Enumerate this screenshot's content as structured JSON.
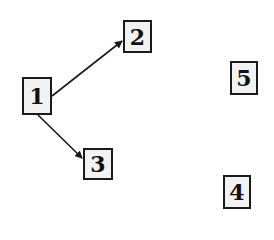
{
  "diagram": {
    "type": "directed-graph",
    "nodes": [
      {
        "id": "1",
        "label": "1",
        "x": 22,
        "y": 77,
        "w": 30,
        "h": 38
      },
      {
        "id": "2",
        "label": "2",
        "x": 123,
        "y": 20,
        "w": 29,
        "h": 33
      },
      {
        "id": "3",
        "label": "3",
        "x": 83,
        "y": 148,
        "w": 30,
        "h": 32
      },
      {
        "id": "4",
        "label": "4",
        "x": 223,
        "y": 175,
        "w": 28,
        "h": 34
      },
      {
        "id": "5",
        "label": "5",
        "x": 230,
        "y": 61,
        "w": 28,
        "h": 34
      }
    ],
    "edges": [
      {
        "from": "1",
        "to": "2"
      },
      {
        "from": "1",
        "to": "3"
      }
    ],
    "colors": {
      "stroke": "#1a1a1a",
      "fill": "#f2f2f2",
      "background": "#ffffff"
    }
  }
}
